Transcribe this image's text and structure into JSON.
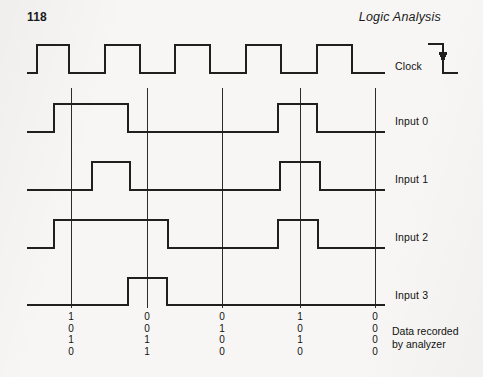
{
  "page": {
    "number": "118",
    "running_head": "Logic Analysis",
    "background_color": "#f7f6f4",
    "ink_color": "#1a1a1a"
  },
  "diagram": {
    "clock": {
      "label": "Clock",
      "edge_marker": "falling-edge-arrow",
      "pulse_count": 5
    },
    "traces": [
      {
        "name": "clock",
        "label": "Clock",
        "baseline_y": 73,
        "high_y": 45
      },
      {
        "name": "input-0",
        "label": "Input 0",
        "baseline_y": 132,
        "high_y": 104
      },
      {
        "name": "input-1",
        "label": "Input 1",
        "baseline_y": 190,
        "high_y": 162
      },
      {
        "name": "input-2",
        "label": "Input 2",
        "baseline_y": 248,
        "high_y": 220
      },
      {
        "name": "input-3",
        "label": "Input 3",
        "baseline_y": 305,
        "high_y": 278
      }
    ],
    "sample_lines_x": [
      71,
      147,
      222,
      300,
      375
    ],
    "trace_start_x": 27,
    "trace_end_x": 385
  },
  "chart_data": {
    "type": "line",
    "xlabel": "",
    "ylabel": "",
    "signal_levels": [
      "0",
      "1"
    ],
    "sample_points_x": [
      71,
      147,
      222,
      300,
      375
    ],
    "series": [
      {
        "name": "Clock",
        "transitions": [
          {
            "x": 27,
            "level": 0
          },
          {
            "x": 37,
            "level": 1
          },
          {
            "x": 69,
            "level": 0
          },
          {
            "x": 105,
            "level": 1
          },
          {
            "x": 140,
            "level": 0
          },
          {
            "x": 175,
            "level": 1
          },
          {
            "x": 210,
            "level": 0
          },
          {
            "x": 246,
            "level": 1
          },
          {
            "x": 281,
            "level": 0
          },
          {
            "x": 317,
            "level": 1
          },
          {
            "x": 352,
            "level": 0
          },
          {
            "x": 385,
            "level": 0
          }
        ]
      },
      {
        "name": "Input 0",
        "transitions": [
          {
            "x": 27,
            "level": 0
          },
          {
            "x": 54,
            "level": 1
          },
          {
            "x": 128,
            "level": 0
          },
          {
            "x": 278,
            "level": 1
          },
          {
            "x": 317,
            "level": 0
          },
          {
            "x": 385,
            "level": 0
          }
        ]
      },
      {
        "name": "Input 1",
        "transitions": [
          {
            "x": 27,
            "level": 0
          },
          {
            "x": 92,
            "level": 1
          },
          {
            "x": 130,
            "level": 0
          },
          {
            "x": 280,
            "level": 1
          },
          {
            "x": 320,
            "level": 0
          },
          {
            "x": 385,
            "level": 0
          }
        ]
      },
      {
        "name": "Input 2",
        "transitions": [
          {
            "x": 27,
            "level": 0
          },
          {
            "x": 54,
            "level": 1
          },
          {
            "x": 168,
            "level": 0
          },
          {
            "x": 278,
            "level": 1
          },
          {
            "x": 318,
            "level": 0
          },
          {
            "x": 385,
            "level": 0
          }
        ]
      },
      {
        "name": "Input 3",
        "transitions": [
          {
            "x": 27,
            "level": 0
          },
          {
            "x": 128,
            "level": 1
          },
          {
            "x": 167,
            "level": 0
          },
          {
            "x": 385,
            "level": 0
          }
        ]
      }
    ]
  },
  "recorded_data": {
    "caption_line1": "Data recorded",
    "caption_line2": "by analyzer",
    "row_labels": [
      "Input 0",
      "Input 1",
      "Input 2",
      "Input 3"
    ],
    "columns": [
      {
        "sample": 1,
        "x": 71,
        "bits": [
          "1",
          "0",
          "1",
          "0"
        ]
      },
      {
        "sample": 2,
        "x": 147,
        "bits": [
          "0",
          "0",
          "1",
          "1"
        ]
      },
      {
        "sample": 3,
        "x": 222,
        "bits": [
          "0",
          "1",
          "0",
          "0"
        ]
      },
      {
        "sample": 4,
        "x": 300,
        "bits": [
          "1",
          "0",
          "1",
          "0"
        ]
      },
      {
        "sample": 5,
        "x": 375,
        "bits": [
          "0",
          "0",
          "0",
          "0"
        ]
      }
    ]
  }
}
